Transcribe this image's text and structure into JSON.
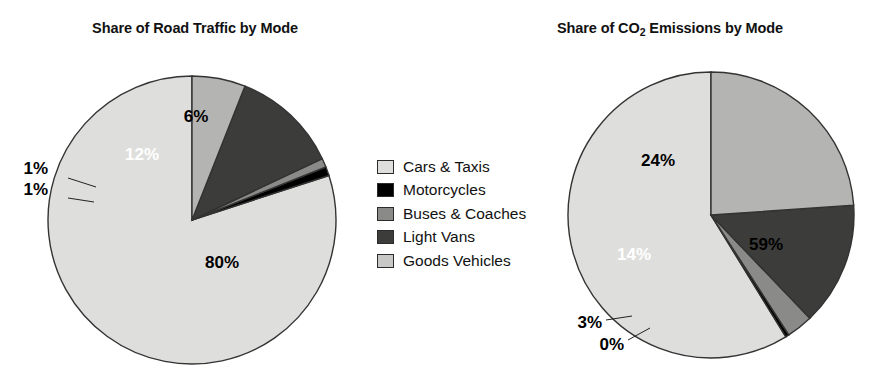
{
  "chart_data": [
    {
      "type": "pie",
      "title": "Share of Road Traffic by Mode",
      "title_prefix": "Share of Road Traffic by Mode",
      "categories": [
        "Cars & Taxis",
        "Motorcycles",
        "Buses & Coaches",
        "Light Vans",
        "Goods Vehicles"
      ],
      "values": [
        80,
        1,
        1,
        12,
        6
      ],
      "labels": [
        "80%",
        "1%",
        "1%",
        "12%",
        "6%"
      ],
      "colors": [
        "#dededc",
        "#000000",
        "#8a8a88",
        "#3c3c3a",
        "#b4b4b2"
      ],
      "start_angle_deg": 90,
      "direction": "counterclockwise",
      "legend_position": "center",
      "grid": false
    },
    {
      "type": "pie",
      "title": "Share of CO2 Emissions by Mode",
      "title_before": "Share of CO",
      "title_sub": "2",
      "title_after": " Emissions by Mode",
      "categories": [
        "Cars & Taxis",
        "Motorcycles",
        "Buses & Coaches",
        "Light Vans",
        "Goods Vehicles"
      ],
      "values": [
        59,
        0.4,
        3,
        14,
        24
      ],
      "labels": [
        "59%",
        "0%",
        "3%",
        "14%",
        "24%"
      ],
      "colors": [
        "#dededc",
        "#000000",
        "#8a8a88",
        "#3c3c3a",
        "#b4b4b2"
      ],
      "start_angle_deg": 90,
      "direction": "counterclockwise",
      "legend_position": "center",
      "grid": false
    }
  ],
  "legend": {
    "items": [
      {
        "label": "Cars & Taxis",
        "color": "#dededc"
      },
      {
        "label": "Motorcycles",
        "color": "#000000"
      },
      {
        "label": "Buses & Coaches",
        "color": "#8a8a88"
      },
      {
        "label": "Light Vans",
        "color": "#3c3c3a"
      },
      {
        "label": "Goods Vehicles",
        "color": "#c8c8c6"
      }
    ]
  },
  "left_chart": {
    "title": "Share of Road Traffic by Mode",
    "label_cars": "80%",
    "label_goods": "6%",
    "label_vans": "12%",
    "label_buses": "1%",
    "label_motorcycles": "1%"
  },
  "right_chart": {
    "title_before": "Share of CO",
    "title_sub": "2",
    "title_after": " Emissions by Mode",
    "label_cars": "59%",
    "label_goods": "24%",
    "label_vans": "14%",
    "label_buses": "3%",
    "label_motorcycles": "0%"
  }
}
